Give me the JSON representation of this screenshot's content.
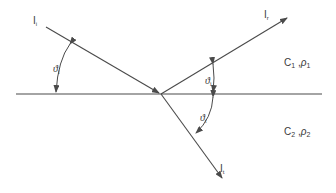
{
  "rays": {
    "incident": {
      "label_main": "I",
      "label_sub": "i"
    },
    "reflected": {
      "label_main": "I",
      "label_sub": "r"
    },
    "transmitted": {
      "label_main": "I",
      "label_sub": "t"
    }
  },
  "angles": {
    "incident": {
      "symbol": "ϑ",
      "sub": "i"
    },
    "reflected": {
      "symbol": "ϑ",
      "sub": "i"
    },
    "transmitted": {
      "symbol": "ϑ",
      "sub": "t"
    }
  },
  "media": {
    "upper": {
      "c": "C",
      "c_sub": "1",
      "sep": " ,",
      "rho": "ρ",
      "rho_sub": "1"
    },
    "lower": {
      "c": "C",
      "c_sub": "2",
      "sep": " ,",
      "rho": "ρ",
      "rho_sub": "2"
    }
  },
  "colors": {
    "ink": "#4a4a4a",
    "background": "#ffffff"
  }
}
